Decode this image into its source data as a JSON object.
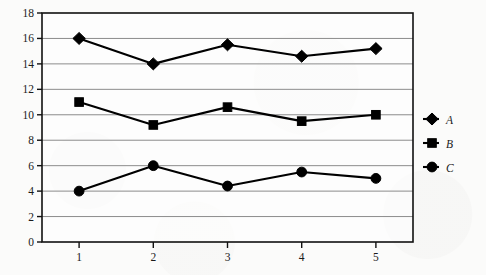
{
  "chart_data": {
    "type": "line",
    "title": "",
    "subtitle": "",
    "xlabel": "",
    "ylabel": "",
    "x": [
      1,
      2,
      3,
      4,
      5
    ],
    "categories": [
      "1",
      "2",
      "3",
      "4",
      "5"
    ],
    "series": [
      {
        "name": "A",
        "marker": "diamond",
        "values": [
          16.0,
          14.0,
          15.5,
          14.6,
          15.2
        ]
      },
      {
        "name": "B",
        "marker": "square",
        "values": [
          11.0,
          9.2,
          10.6,
          9.5,
          10.0
        ]
      },
      {
        "name": "C",
        "marker": "circle",
        "values": [
          4.0,
          6.0,
          4.4,
          5.5,
          5.0
        ]
      }
    ],
    "ylim": [
      0,
      18
    ],
    "ytick_step": 2,
    "yticks": [
      0,
      2,
      4,
      6,
      8,
      10,
      12,
      14,
      16,
      18
    ],
    "ytick_labels": [
      "0",
      "2",
      "4",
      "6",
      "8",
      "10",
      "12",
      "14",
      "16",
      "18"
    ],
    "xlim": [
      0.5,
      5.5
    ],
    "xticks": [
      1,
      2,
      3,
      4,
      5
    ],
    "xtick_labels": [
      "1",
      "2",
      "3",
      "4",
      "5"
    ],
    "grid": "horizontal",
    "legend_position": "right",
    "legend_entries": [
      "A",
      "B",
      "C"
    ],
    "colors": {
      "series": "#000000",
      "grid": "#8c8c8c",
      "frame": "#111111",
      "background": "#fbfbfa",
      "text": "#1a1a1a"
    }
  }
}
